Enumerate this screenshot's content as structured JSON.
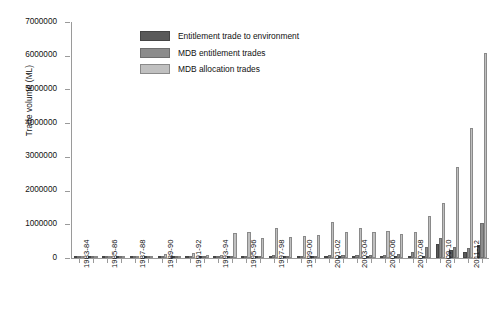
{
  "chart_data": {
    "type": "bar",
    "title": "",
    "xlabel": "",
    "ylabel": "Trade volume (ML)",
    "ylim": [
      0,
      7000000
    ],
    "ytick_step": 1000000,
    "ytick_labels": [
      "0",
      "1000000",
      "2000000",
      "3000000",
      "4000000",
      "5000000",
      "6000000",
      "7000000"
    ],
    "grid": false,
    "legend_position": "top-center",
    "label_interval": 2,
    "categories": [
      "1983-84",
      "1984-85",
      "1985-86",
      "1986-87",
      "1987-88",
      "1988-89",
      "1989-90",
      "1990-91",
      "1991-92",
      "1992-93",
      "1993-94",
      "1994-95",
      "1995-96",
      "1996-97",
      "1997-98",
      "1998-99",
      "1999-00",
      "2000-01",
      "2001-02",
      "2002-03",
      "2003-04",
      "2004-05",
      "2005-06",
      "2006-07",
      "2007-08",
      "2008-09",
      "2009-10",
      "2010-11",
      "2011-12",
      "2012-13"
    ],
    "tick_labels": [
      "1983-84",
      "",
      "1985-86",
      "",
      "1987-88",
      "",
      "1989-90",
      "",
      "1991-92",
      "",
      "1993-94",
      "",
      "1995-96",
      "",
      "1997-98",
      "",
      "1999-00",
      "",
      "2001-02",
      "",
      "2003-04",
      "",
      "2005-06",
      "",
      "2007-08",
      "",
      "2009-10",
      "",
      "2011-12",
      ""
    ],
    "series": [
      {
        "name": "Entitlement trade to environment",
        "color": "#5a5a5a",
        "values": [
          0,
          0,
          0,
          0,
          0,
          0,
          0,
          0,
          0,
          0,
          0,
          0,
          0,
          0,
          0,
          0,
          0,
          0,
          0,
          0,
          0,
          0,
          0,
          0,
          0,
          60000,
          430000,
          250000,
          180000,
          400000
        ]
      },
      {
        "name": "MDB entitlement trades",
        "color": "#8c8c8c",
        "values": [
          0,
          0,
          20000,
          20000,
          30000,
          10000,
          40000,
          30000,
          60000,
          40000,
          50000,
          40000,
          70000,
          60000,
          80000,
          60000,
          70000,
          60000,
          90000,
          80000,
          90000,
          90000,
          100000,
          110000,
          180000,
          330000,
          600000,
          330000,
          300000,
          1050000
        ]
      },
      {
        "name": "MDB allocation trades",
        "color": "#c0c0c0",
        "values": [
          0,
          0,
          20000,
          20000,
          40000,
          20000,
          120000,
          60000,
          160000,
          80000,
          100000,
          740000,
          780000,
          580000,
          900000,
          620000,
          660000,
          680000,
          1080000,
          780000,
          900000,
          760000,
          800000,
          700000,
          760000,
          1240000,
          1620000,
          2700000,
          3870000,
          6080000
        ]
      }
    ]
  },
  "legend": {
    "items": [
      {
        "label": "Entitlement trade to environment",
        "swatch": "s0"
      },
      {
        "label": "MDB entitlement trades",
        "swatch": "s1"
      },
      {
        "label": "MDB allocation trades",
        "swatch": "s2"
      }
    ]
  }
}
